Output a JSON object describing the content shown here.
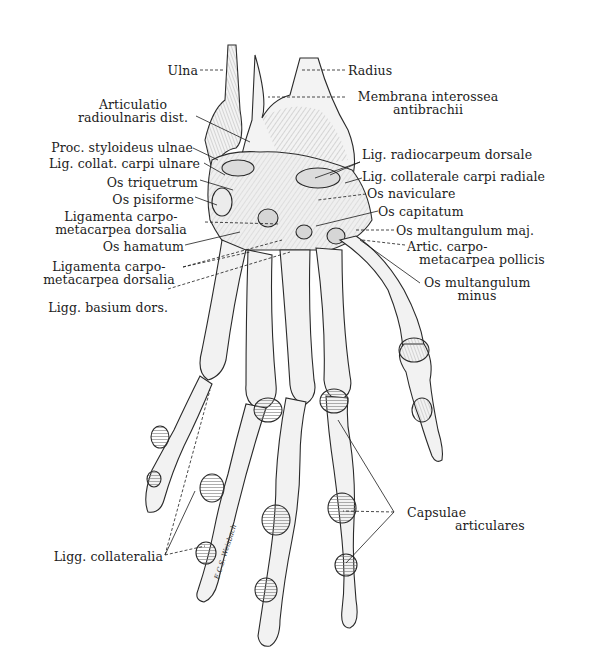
{
  "figure": {
    "colors": {
      "background": "#ffffff",
      "ink": "#1c1c1c",
      "bone_fill": "#f1f1f1",
      "shade": "#b8b8b8"
    }
  },
  "labels_left": [
    {
      "id": "ulna",
      "lines": [
        "Ulna"
      ]
    },
    {
      "id": "art-radioulnaris",
      "lines": [
        "Articulatio",
        "radioulnaris  dist."
      ]
    },
    {
      "id": "proc-styloideus",
      "lines": [
        "Proc. styloideus ulnae"
      ]
    },
    {
      "id": "lig-collat-ulnare",
      "lines": [
        "Lig. collat. carpi ulnare"
      ]
    },
    {
      "id": "os-triquetrum",
      "lines": [
        "Os triquetrum"
      ]
    },
    {
      "id": "os-pisiforme",
      "lines": [
        "Os  pisiforme"
      ]
    },
    {
      "id": "lig-carpometacarpea-1",
      "lines": [
        "Ligamenta  carpo-",
        "metacarpea  dorsalia"
      ]
    },
    {
      "id": "os-hamatum",
      "lines": [
        "Os  hamatum"
      ]
    },
    {
      "id": "lig-carpometacarpea-2",
      "lines": [
        "Ligamenta  carpo-",
        "metacarpea  dorsalia"
      ]
    },
    {
      "id": "ligg-basium",
      "lines": [
        "Ligg. basium dors."
      ]
    },
    {
      "id": "ligg-collateralia",
      "lines": [
        "Ligg. collateralia"
      ]
    }
  ],
  "labels_right": [
    {
      "id": "radius",
      "lines": [
        "Radius"
      ]
    },
    {
      "id": "membrana",
      "lines": [
        "Membrana interossea",
        "antibrachii"
      ]
    },
    {
      "id": "lig-radiocarpeum",
      "lines": [
        "Lig. radiocarpeum dorsale"
      ]
    },
    {
      "id": "lig-collat-radiale",
      "lines": [
        "Lig. collaterale carpi radiale"
      ]
    },
    {
      "id": "os-naviculare",
      "lines": [
        "Os naviculare"
      ]
    },
    {
      "id": "os-capitatum",
      "lines": [
        "Os  capitatum"
      ]
    },
    {
      "id": "os-multangulum-maj",
      "lines": [
        "Os  multangulum  maj."
      ]
    },
    {
      "id": "artic-pollicis",
      "lines": [
        "Artic.  carpo-",
        "metacarpea  pollicis"
      ]
    },
    {
      "id": "os-multangulum-minus",
      "lines": [
        "Os  multangulum",
        "minus"
      ]
    },
    {
      "id": "capsulae",
      "lines": [
        "Capsulae",
        "articulares"
      ]
    }
  ],
  "signature": "E.C.S. Weisbach"
}
